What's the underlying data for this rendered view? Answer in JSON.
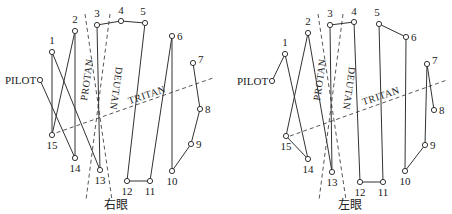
{
  "panels": [
    {
      "caption": "右眼",
      "pilot_label": "PILOT",
      "axes": [
        {
          "name": "PROTAN",
          "label": "PROTAN",
          "x1": 85,
          "y1": 14,
          "x2": 112,
          "y2": 200,
          "lx": 90,
          "ly": 80,
          "rot": -82
        },
        {
          "name": "DEUTAN",
          "label": "DEUTAN",
          "x1": 110,
          "y1": 14,
          "x2": 86,
          "y2": 200,
          "lx": 113,
          "ly": 88,
          "rot": 98
        },
        {
          "name": "TRITAN",
          "label": "TRITAN",
          "x1": 50,
          "y1": 135,
          "x2": 213,
          "y2": 78,
          "lx": 148,
          "ly": 98,
          "rot": -19
        }
      ],
      "points": {
        "PILOT": [
          40,
          80
        ],
        "1": [
          52,
          52
        ],
        "2": [
          75,
          31
        ],
        "3": [
          97,
          25
        ],
        "4": [
          121,
          21
        ],
        "5": [
          145,
          23
        ],
        "6": [
          172,
          36
        ],
        "7": [
          193,
          63
        ],
        "8": [
          200,
          109
        ],
        "9": [
          191,
          144
        ],
        "10": [
          172,
          171
        ],
        "11": [
          150,
          181
        ],
        "12": [
          127,
          181
        ],
        "13": [
          100,
          170
        ],
        "14": [
          75,
          158
        ],
        "15": [
          52,
          135
        ]
      },
      "sequence": [
        "PILOT",
        "14",
        "2",
        "15",
        "1",
        "13",
        "3",
        "4",
        "5",
        "12",
        "11",
        "6",
        "10",
        "9",
        "8",
        "7"
      ],
      "caption_x": 116,
      "caption_y": 209
    },
    {
      "caption": "左眼",
      "pilot_label": "PILOT",
      "axes": [
        {
          "name": "PROTAN",
          "label": "PROTAN",
          "x1": 318,
          "y1": 14,
          "x2": 346,
          "y2": 200,
          "lx": 323,
          "ly": 80,
          "rot": -82
        },
        {
          "name": "DEUTAN",
          "label": "DEUTAN",
          "x1": 343,
          "y1": 14,
          "x2": 319,
          "y2": 200,
          "lx": 346,
          "ly": 88,
          "rot": 98
        },
        {
          "name": "TRITAN",
          "label": "TRITAN",
          "x1": 290,
          "y1": 136,
          "x2": 447,
          "y2": 80,
          "lx": 382,
          "ly": 99,
          "rot": -19
        }
      ],
      "points": {
        "PILOT": [
          272,
          81
        ],
        "1": [
          285,
          54
        ],
        "2": [
          308,
          33
        ],
        "3": [
          330,
          25
        ],
        "4": [
          354,
          22
        ],
        "5": [
          379,
          24
        ],
        "6": [
          406,
          37
        ],
        "7": [
          427,
          64
        ],
        "8": [
          434,
          110
        ],
        "9": [
          425,
          145
        ],
        "10": [
          405,
          171
        ],
        "11": [
          383,
          182
        ],
        "12": [
          360,
          182
        ],
        "13": [
          332,
          172
        ],
        "14": [
          308,
          159
        ],
        "15": [
          286,
          136
        ]
      },
      "sequence": [
        "PILOT",
        "1",
        "14",
        "15",
        "2",
        "13",
        "3",
        "4",
        "12",
        "11",
        "5",
        "6",
        "10",
        "9",
        "7",
        "8"
      ],
      "caption_x": 350,
      "caption_y": 209
    }
  ],
  "label_offsets": {
    "PILOT": [
      -35,
      4,
      "start"
    ],
    "1": [
      0,
      -8,
      "middle"
    ],
    "2": [
      0,
      -8,
      "middle"
    ],
    "3": [
      0,
      -8,
      "middle"
    ],
    "4": [
      0,
      -7,
      "middle"
    ],
    "5": [
      -2,
      -8,
      "middle"
    ],
    "6": [
      5,
      4,
      "start"
    ],
    "7": [
      5,
      0,
      "start"
    ],
    "8": [
      5,
      4,
      "start"
    ],
    "9": [
      5,
      4,
      "start"
    ],
    "10": [
      0,
      14,
      "middle"
    ],
    "11": [
      0,
      14,
      "middle"
    ],
    "12": [
      0,
      14,
      "middle"
    ],
    "13": [
      0,
      14,
      "middle"
    ],
    "14": [
      0,
      14,
      "middle"
    ],
    "15": [
      0,
      14,
      "middle"
    ]
  },
  "colors": {
    "line": "#333333",
    "dash": "#444444",
    "point_fill": "#ffffff"
  }
}
